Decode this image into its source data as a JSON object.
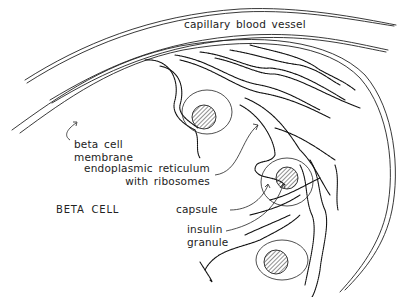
{
  "diagram": {
    "labels": {
      "capillary": "capillary blood vessel",
      "membrane_line1": "beta cell",
      "membrane_line2": "membrane",
      "er_line1": "endoplasmic reticulum",
      "er_line2": "with ribosomes",
      "beta_cell": "BETA CELL",
      "capsule": "capsule",
      "insulin_line1": "insulin",
      "insulin_line2": "granule"
    },
    "structures": [
      "capillary-blood-vessel",
      "beta-cell-membrane",
      "endoplasmic-reticulum",
      "capsule",
      "insulin-granule"
    ],
    "colors": {
      "ink": "#222222",
      "background": "#ffffff"
    }
  }
}
